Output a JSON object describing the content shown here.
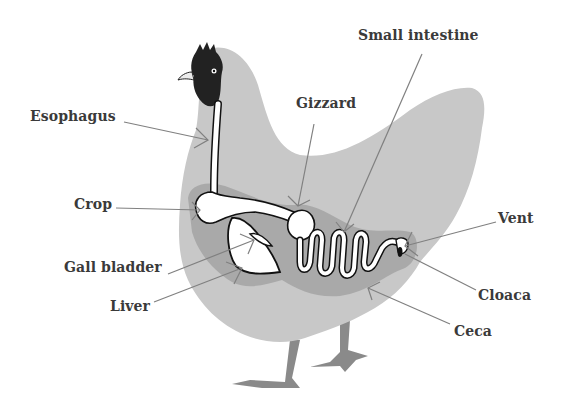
{
  "diagram": {
    "colors": {
      "body": "#c8c8c8",
      "organ_region": "#a9a9a9",
      "organ_fill": "#ffffff",
      "organ_outline": "#111111",
      "head": "#222222",
      "legs": "#8a8a8a",
      "leader_line": "#808080",
      "label_text": "#3a3a3a"
    },
    "labels": {
      "esophagus": "Esophagus",
      "crop": "Crop",
      "gall_bladder": "Gall bladder",
      "liver": "Liver",
      "gizzard": "Gizzard",
      "small_intestine": "Small intestine",
      "vent": "Vent",
      "cloaca": "Cloaca",
      "ceca": "Ceca"
    }
  }
}
